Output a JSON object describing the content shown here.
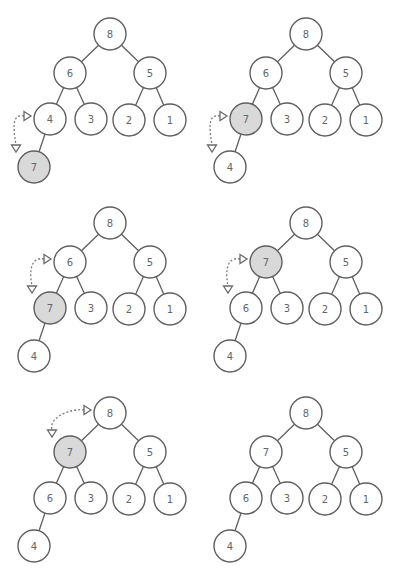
{
  "colors": {
    "stroke": "#5f5f5f",
    "label": "#666666",
    "highlight_fill": "#d9d9d9",
    "node_fill": "#ffffff",
    "arrow": "#7a7a7a"
  },
  "layout": {
    "node_radius": 16,
    "slots": {
      "root": [
        110,
        34
      ],
      "L": [
        70,
        73
      ],
      "R": [
        150,
        73
      ],
      "LL": [
        50,
        119
      ],
      "LR": [
        91,
        119
      ],
      "RL": [
        129,
        120
      ],
      "RR": [
        170,
        120
      ],
      "LLL": [
        34,
        167
      ]
    },
    "edges": [
      [
        "root",
        "L"
      ],
      [
        "root",
        "R"
      ],
      [
        "L",
        "LL"
      ],
      [
        "L",
        "LR"
      ],
      [
        "R",
        "RL"
      ],
      [
        "R",
        "RR"
      ],
      [
        "LL",
        "LLL"
      ]
    ]
  },
  "panels": [
    {
      "id": "step-1",
      "offset": [
        0,
        0
      ],
      "values": {
        "root": "8",
        "L": "6",
        "R": "5",
        "LL": "4",
        "LR": "3",
        "RL": "2",
        "RR": "1",
        "LLL": "7"
      },
      "highlight": "LLL",
      "swap": [
        "LL",
        "LLL"
      ]
    },
    {
      "id": "step-2",
      "offset": [
        196,
        0
      ],
      "values": {
        "root": "8",
        "L": "6",
        "R": "5",
        "LL": "7",
        "LR": "3",
        "RL": "2",
        "RR": "1",
        "LLL": "4"
      },
      "highlight": "LL",
      "swap": [
        "LL",
        "LLL"
      ]
    },
    {
      "id": "step-3",
      "offset": [
        0,
        189
      ],
      "values": {
        "root": "8",
        "L": "6",
        "R": "5",
        "LL": "7",
        "LR": "3",
        "RL": "2",
        "RR": "1",
        "LLL": "4"
      },
      "highlight": "LL",
      "swap": [
        "L",
        "LL"
      ]
    },
    {
      "id": "step-4",
      "offset": [
        196,
        189
      ],
      "values": {
        "root": "8",
        "L": "7",
        "R": "5",
        "LL": "6",
        "LR": "3",
        "RL": "2",
        "RR": "1",
        "LLL": "4"
      },
      "highlight": "L",
      "swap": [
        "L",
        "LL"
      ]
    },
    {
      "id": "step-5",
      "offset": [
        0,
        379
      ],
      "values": {
        "root": "8",
        "L": "7",
        "R": "5",
        "LL": "6",
        "LR": "3",
        "RL": "2",
        "RR": "1",
        "LLL": "4"
      },
      "highlight": "L",
      "swap": [
        "root",
        "L"
      ]
    },
    {
      "id": "step-6",
      "offset": [
        196,
        379
      ],
      "values": {
        "root": "8",
        "L": "7",
        "R": "5",
        "LL": "6",
        "LR": "3",
        "RL": "2",
        "RR": "1",
        "LLL": "4"
      },
      "highlight": null,
      "swap": null
    }
  ]
}
